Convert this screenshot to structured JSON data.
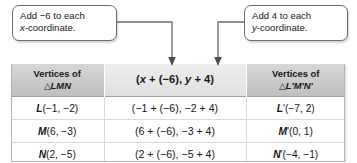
{
  "callouts": {
    "left": {
      "name": "add-x-callout",
      "line1": "Add −6 to each",
      "line2_italic": "x",
      "line2_rest": "-coordinate."
    },
    "right": {
      "name": "add-y-callout",
      "line1": "Add 4 to each",
      "line2_italic": "y",
      "line2_rest": "-coordinate."
    }
  },
  "table": {
    "headers": {
      "col1_line1": "Vertices of",
      "col1_triangle": "△",
      "col1_label": "LMN",
      "col2": "(x + (−6), y + 4)",
      "col3_line1": "Vertices of",
      "col3_triangle": "△",
      "col3_label": "L′M′N′"
    },
    "rows": [
      {
        "vertex_letter": "L",
        "vertex": "L(−1, −2)",
        "computation": "(−1 + (−6), −2 + 4)",
        "image_vertex": "L′(−7, 2)"
      },
      {
        "vertex_letter": "M",
        "vertex": "M(6, −3)",
        "computation": "(6 + (−6), −3 + 4)",
        "image_vertex": "M′(0, 1)"
      },
      {
        "vertex_letter": "N",
        "vertex": "N(2, −5)",
        "computation": "(2 + (−6), −5 + 4)",
        "image_vertex": "N′(−4, −1)"
      }
    ]
  },
  "colors": {
    "header_side_bg": "#cacaca",
    "header_mid_bg": "#e6e6e6",
    "body_bg": "#ffffff",
    "border": "#b4b4b4",
    "connector": "#6b6b6b",
    "text": "#16181a"
  },
  "connectors": [
    {
      "name": "arrow-to-x-column",
      "target": "middle-column-left"
    },
    {
      "name": "arrow-to-y-column",
      "target": "middle-column-right"
    }
  ]
}
